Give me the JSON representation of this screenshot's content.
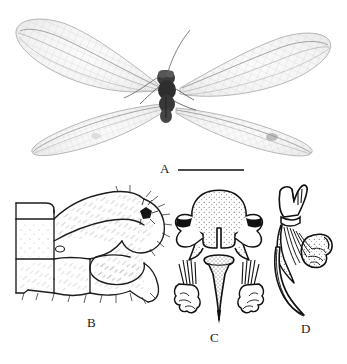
{
  "figure": {
    "kind": "scientific-plate",
    "background_color": "#ffffff",
    "ink_color": "#1c1c1c",
    "panel_count": 4
  },
  "panels": [
    {
      "id": "A",
      "label": "A",
      "type": "photograph",
      "content": "dorsal habitus of adult lacewing with two pairs of translucent net-veined wings, dark body and long antennae"
    },
    {
      "id": "B",
      "label": "B",
      "type": "line-drawing",
      "content": "lateral view of abdominal apex, segments eight and nine with ectoproct, setae and spiracle"
    },
    {
      "id": "C",
      "label": "C",
      "type": "line-drawing",
      "content": "genitalia ventral view: gonarcus with arcessus and paired gonosetae tufts"
    },
    {
      "id": "D",
      "label": "D",
      "type": "line-drawing",
      "content": "genitalia lateral view: hooked arcessus with striated gonocristae"
    }
  ],
  "scale_bar": {
    "present": true,
    "orientation": "horizontal",
    "caption": "",
    "length_px": 66
  },
  "colors": {
    "ink": "#1c1c1c",
    "wing_membrane": "#f2f2f2",
    "wing_vein": "#8c8c8c",
    "body_dark": "#2b2b2b",
    "stipple": "#444444",
    "scale_bar": "#4a4a4a"
  }
}
